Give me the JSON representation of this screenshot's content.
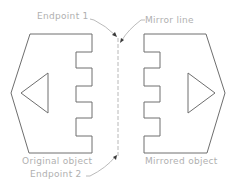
{
  "diagram": {
    "labels": {
      "endpoint1": "Endpoint 1",
      "mirror_line": "Mirror line",
      "original_object": "Original object",
      "endpoint2": "Endpoint 2",
      "mirrored_object": "Mirrored object"
    },
    "colors": {
      "outline": "#6e6e6e",
      "label_text": "#b0b0b0",
      "mirror_line": "#b8b8b8",
      "leader": "#a8a8a8",
      "arrowhead": "#3a3a3a"
    },
    "mirror_line": {
      "x": 118,
      "y_start": 38,
      "y_end": 157,
      "style": "dashed"
    },
    "original_object": {
      "outline_points": [
        [
          30,
          34
        ],
        [
          92,
          34
        ],
        [
          92,
          52
        ],
        [
          76,
          52
        ],
        [
          76,
          68
        ],
        [
          92,
          68
        ],
        [
          92,
          86
        ],
        [
          76,
          86
        ],
        [
          76,
          102
        ],
        [
          92,
          102
        ],
        [
          92,
          118
        ],
        [
          76,
          118
        ],
        [
          76,
          136
        ],
        [
          92,
          136
        ],
        [
          92,
          153
        ],
        [
          29,
          153
        ],
        [
          11,
          93
        ]
      ],
      "triangle_points": [
        [
          21,
          93
        ],
        [
          48,
          73
        ],
        [
          48,
          113
        ]
      ],
      "triangle_direction": "left"
    },
    "mirrored_object": {
      "outline_points": [
        [
          206,
          34
        ],
        [
          144,
          34
        ],
        [
          144,
          52
        ],
        [
          160,
          52
        ],
        [
          160,
          68
        ],
        [
          144,
          68
        ],
        [
          144,
          86
        ],
        [
          160,
          86
        ],
        [
          160,
          102
        ],
        [
          144,
          102
        ],
        [
          144,
          118
        ],
        [
          160,
          118
        ],
        [
          160,
          136
        ],
        [
          144,
          136
        ],
        [
          144,
          153
        ],
        [
          207,
          153
        ],
        [
          225,
          93
        ]
      ],
      "triangle_points": [
        [
          215,
          93
        ],
        [
          188,
          73
        ],
        [
          188,
          113
        ]
      ],
      "triangle_direction": "right"
    }
  }
}
